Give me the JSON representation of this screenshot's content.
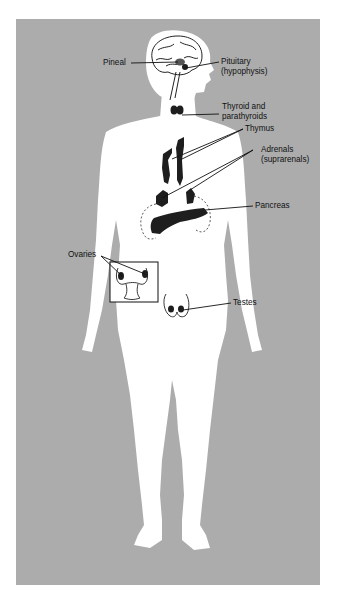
{
  "figure": {
    "colors": {
      "background": "#acacac",
      "body": "#ffffff",
      "gland": "#1e1e1e",
      "text": "#111111"
    }
  },
  "labels": {
    "pineal": "Pineal",
    "pituitary_line1": "Pituitary",
    "pituitary_line2": "(hypophysis)",
    "thyroid_line1": "Thyroid and",
    "thyroid_line2": "parathyroids",
    "thymus": "Thymus",
    "adrenals_line1": "Adrenals",
    "adrenals_line2": "(suprarenals)",
    "pancreas": "Pancreas",
    "ovaries": "Ovaries",
    "testes": "Testes"
  }
}
